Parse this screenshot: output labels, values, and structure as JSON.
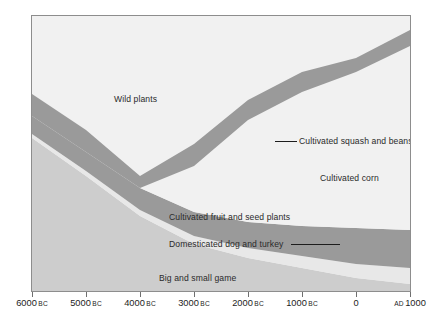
{
  "chart_data": {
    "type": "area",
    "title": "",
    "subtitle": "",
    "xlabel": "",
    "ylabel": "",
    "stacked": true,
    "percent": true,
    "grid": false,
    "legend_position": "inline-labels",
    "xlim": [
      -6000,
      1000
    ],
    "ylim": [
      0,
      100
    ],
    "x_tick_values": [
      -6000,
      -5000,
      -4000,
      -3000,
      -2000,
      -1000,
      0,
      1000
    ],
    "x_tick_labels": [
      {
        "number": "6000",
        "era": "BC",
        "era_position": "after"
      },
      {
        "number": "5000",
        "era": "BC",
        "era_position": "after"
      },
      {
        "number": "4000",
        "era": "BC",
        "era_position": "after"
      },
      {
        "number": "3000",
        "era": "BC",
        "era_position": "after"
      },
      {
        "number": "2000",
        "era": "BC",
        "era_position": "after"
      },
      {
        "number": "1000",
        "era": "BC",
        "era_position": "after"
      },
      {
        "number": "0",
        "era": "",
        "era_position": "after"
      },
      {
        "number": "1000",
        "era": "AD",
        "era_position": "before"
      }
    ],
    "x": [
      -6000,
      -5000,
      -4000,
      -3000,
      -2000,
      -1000,
      0,
      1000
    ],
    "series": [
      {
        "name": "Wild plants",
        "color": "#f1f1f1",
        "values": [
          100,
          92,
          84,
          70,
          52,
          38,
          30,
          22
        ]
      },
      {
        "name": "Cultivated squash and beans",
        "color": "#9a9a9a",
        "values": [
          0,
          0,
          2,
          8,
          10,
          8,
          8,
          8
        ]
      },
      {
        "name": "Cultivated corn",
        "color": "#f1f1f1",
        "values": [
          0,
          0,
          0,
          4,
          16,
          30,
          38,
          48
        ]
      },
      {
        "name": "Cultivated fruit and seed plants",
        "color": "#9a9a9a",
        "values": [
          6,
          8,
          8,
          8,
          8,
          9,
          10,
          10
        ]
      },
      {
        "name": "Domesticated dog and turkey",
        "color": "#cdcdcd",
        "values": [
          0,
          0,
          1,
          2,
          3,
          4,
          5,
          6
        ]
      },
      {
        "name": "Big and small game",
        "color": "#cdcdcd",
        "values": [
          94,
          86,
          78,
          66,
          54,
          42,
          34,
          28
        ]
      }
    ],
    "band_labels": [
      {
        "id": "wild-plants",
        "text": "Wild plants"
      },
      {
        "id": "squash-beans",
        "text": "Cultivated squash and beans"
      },
      {
        "id": "corn",
        "text": "Cultivated corn"
      },
      {
        "id": "fruit-seed",
        "text": "Cultivated fruit and seed plants"
      },
      {
        "id": "dog-turkey",
        "text": "Domesticated dog and turkey"
      },
      {
        "id": "big-small-game",
        "text": "Big and small game"
      }
    ],
    "colors": {
      "light_band": "#f1f1f1",
      "dark_band": "#9a9a9a",
      "mid_band": "#cdcdcd",
      "frame": "#8d8d8d",
      "text": "#1d1d1d",
      "leader_line": "#1d1d1d"
    }
  }
}
